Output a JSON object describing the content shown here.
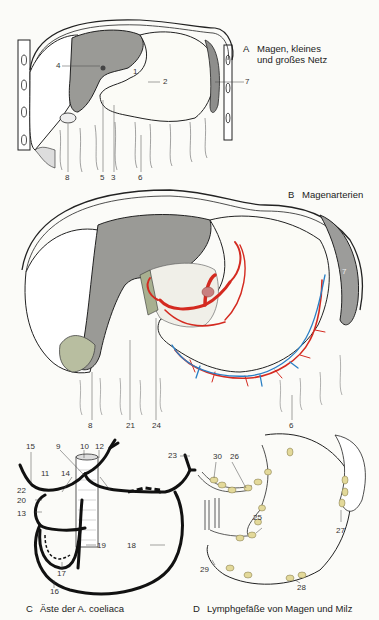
{
  "panels": {
    "A": {
      "letter": "A",
      "title_line1": "Magen, kleines",
      "title_line2": "und großes Netz",
      "labels": [
        "1",
        "2",
        "3",
        "4",
        "5",
        "6",
        "7",
        "8"
      ]
    },
    "B": {
      "letter": "B",
      "title": "Magenarterien",
      "labels": [
        "6",
        "7",
        "8",
        "21",
        "24"
      ]
    },
    "C": {
      "letter": "C",
      "title": "Äste der A. coeliaca",
      "labels": [
        "9",
        "10",
        "11",
        "12",
        "13",
        "14",
        "15",
        "16",
        "17",
        "18",
        "19",
        "20",
        "22",
        "23"
      ]
    },
    "D": {
      "letter": "D",
      "title": "Lymphgefäße von Magen und Milz",
      "labels": [
        "25",
        "26",
        "27",
        "28",
        "29",
        "30"
      ]
    }
  },
  "colors": {
    "liver": "#9a9a96",
    "spleen": "#9c9c9a",
    "artery": "#d42a20",
    "vein": "#2a7fc4",
    "gallbladder": "#b8bea0",
    "lymph_node": "#e3d99a",
    "outline": "#1a1a1a"
  }
}
